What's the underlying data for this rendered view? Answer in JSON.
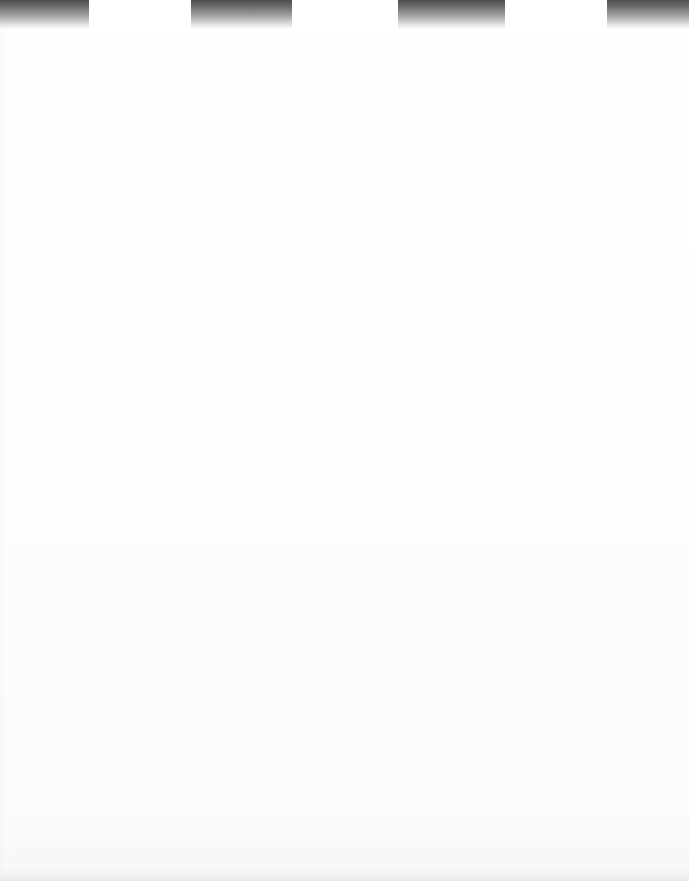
{
  "document": {
    "kind": "scanned-page",
    "page_width": 689,
    "page_height": 881,
    "page_background": "#ffffff",
    "body_text": "",
    "body_note": ""
  },
  "top_band": {
    "name": "scan-edge-artifact",
    "band_height": 30,
    "gradient_top_color": "#4c4c4c",
    "gradient_bottom_color": "#ffffff",
    "blocks": [
      {
        "label": "block-1",
        "x": 0,
        "width": 89,
        "top_color": "#4c4c4c"
      },
      {
        "label": "block-2",
        "x": 191,
        "width": 101,
        "top_color": "#4e4e4e"
      },
      {
        "label": "block-3",
        "x": 398,
        "width": 107,
        "top_color": "#4e4e4e"
      },
      {
        "label": "block-4",
        "x": 607,
        "width": 82,
        "top_color": "#505050"
      }
    ]
  },
  "page_surface": {
    "label": "blank-paper-area",
    "tint": "#fdfdfd"
  },
  "bottom_edge": {
    "label": "bottom-edge-smudge",
    "tint": "#eaeaea"
  }
}
